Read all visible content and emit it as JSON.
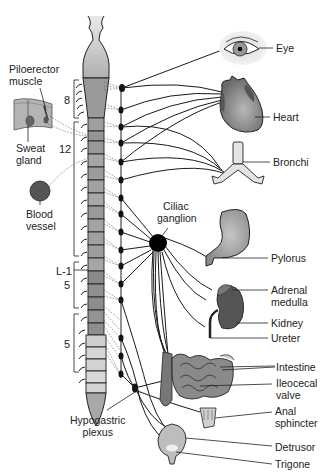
{
  "left_labels": {
    "piloerector": [
      "Piloerector",
      "muscle"
    ],
    "sweat_gland": [
      "Sweat",
      "gland"
    ],
    "blood_vessel": [
      "Blood",
      "vessel"
    ],
    "ciliac_ganglion": [
      "Ciliac",
      "ganglion"
    ],
    "hypogastric_plexus": [
      "Hypogastric",
      "plexus"
    ]
  },
  "spinal_segments": {
    "t8": "8",
    "t12": "12",
    "l1": "L-1",
    "l5": "5",
    "s5": "5"
  },
  "organs": [
    {
      "id": "eye",
      "label": [
        "Eye"
      ]
    },
    {
      "id": "heart",
      "label": [
        "Heart"
      ]
    },
    {
      "id": "bronchi",
      "label": [
        "Bronchi"
      ]
    },
    {
      "id": "pylorus",
      "label": [
        "Pylorus"
      ]
    },
    {
      "id": "adrenal",
      "label": [
        "Adrenal",
        "medulla"
      ]
    },
    {
      "id": "kidney",
      "label": [
        "Kidney"
      ]
    },
    {
      "id": "ureter",
      "label": [
        "Ureter"
      ]
    },
    {
      "id": "intestine",
      "label": [
        "Intestine"
      ]
    },
    {
      "id": "ileocecal",
      "label": [
        "Ileocecal",
        "valve"
      ]
    },
    {
      "id": "anal",
      "label": [
        "Anal",
        "sphincter"
      ]
    },
    {
      "id": "detrusor",
      "label": [
        "Detrusor"
      ]
    },
    {
      "id": "trigone",
      "label": [
        "Trigone"
      ]
    }
  ]
}
